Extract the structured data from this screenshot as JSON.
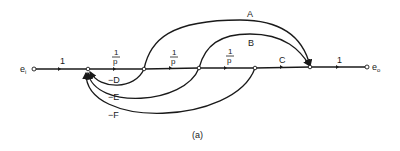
{
  "diagram": {
    "type": "signal-flow-graph",
    "caption": "(a)",
    "input_label": "e",
    "input_sub": "i",
    "output_label": "e",
    "output_sub": "o",
    "forward_gains": [
      "1",
      "1/p",
      "1/p",
      "1/p",
      "C",
      "1"
    ],
    "frac_num": "1",
    "frac_den": "p",
    "feedforward": [
      {
        "label": "A",
        "from": "node2",
        "to": "node5"
      },
      {
        "label": "B",
        "from": "node3",
        "to": "node5"
      }
    ],
    "feedback": [
      {
        "label": "−D",
        "from": "node2",
        "to": "node1"
      },
      {
        "label": "−E",
        "from": "node3",
        "to": "node1"
      },
      {
        "label": "−F",
        "from": "node4",
        "to": "node1"
      }
    ],
    "labels": {
      "g1": "1",
      "c": "C",
      "g_out": "1",
      "a": "A",
      "b": "B",
      "d": "−D",
      "e": "−E",
      "f": "−F"
    }
  }
}
